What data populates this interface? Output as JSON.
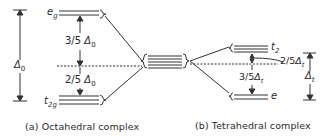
{
  "diagram": {
    "type": "crystal-field-splitting",
    "octahedral": {
      "caption": "(a) Octahedral complex",
      "upper_level": "e",
      "upper_level_sub": "g",
      "lower_level": "t",
      "lower_level_sub": "2g",
      "upper_gap": "3/5",
      "lower_gap": "2/5",
      "delta_symbol": "Δ",
      "delta_sub": "0",
      "total_split": "Δ",
      "total_split_sub": "0"
    },
    "tetrahedral": {
      "caption": "(b) Tetrahedral complex",
      "upper_level": "t",
      "upper_level_sub": "2",
      "lower_level": "e",
      "upper_gap": "2/5",
      "lower_gap": "3/5",
      "delta_symbol": "Δ",
      "delta_sub": "t",
      "total_split": "Δ",
      "total_split_sub": "t"
    },
    "center": {
      "degenerate_levels": 5
    },
    "colors": {
      "line": "#333333",
      "background": "#ffffff"
    }
  }
}
